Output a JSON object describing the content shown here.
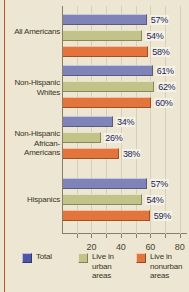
{
  "chart_data": {
    "type": "bar",
    "orientation": "horizontal",
    "title": "",
    "xlabel": "",
    "ylabel": "",
    "xlim": [
      0,
      85
    ],
    "grid": true,
    "xticks": [
      20,
      40,
      60,
      80
    ],
    "categories": [
      "All Americans",
      "Non-Hispanic Whites",
      "Non-Hispanic African-Americans",
      "Hispanics"
    ],
    "category_lines": [
      [
        "All Americans"
      ],
      [
        "Non-Hispanic",
        "Whites"
      ],
      [
        "Non-Hispanic",
        "African-",
        "Americans"
      ],
      [
        "Hispanics"
      ]
    ],
    "series": [
      {
        "name": "Total",
        "color": "#4F55A6",
        "bar_color": "#7F83B8",
        "values": [
          57,
          61,
          34,
          57
        ],
        "labels": [
          "57%",
          "61%",
          "34%",
          "57%"
        ]
      },
      {
        "name": "Live in urban areas",
        "color": "#C3C389",
        "bar_color": "#C3C389",
        "values": [
          54,
          62,
          26,
          54
        ],
        "labels": [
          "54%",
          "62%",
          "26%",
          "54%"
        ]
      },
      {
        "name": "Live in nonurban areas",
        "color": "#E2743C",
        "bar_color": "#E2743C",
        "values": [
          58,
          60,
          38,
          59
        ],
        "labels": [
          "58%",
          "60%",
          "38%",
          "59%"
        ]
      }
    ],
    "legend": {
      "position": "bottom",
      "entries": [
        {
          "label_lines": [
            "Total"
          ],
          "swatch": "#4F55A6"
        },
        {
          "label_lines": [
            "Live in",
            "urban",
            "areas"
          ],
          "swatch": "#C3C389"
        },
        {
          "label_lines": [
            "Live in",
            "nonurban",
            "areas"
          ],
          "swatch": "#E2743C"
        }
      ]
    },
    "background_color": "#ECE6D2",
    "accent_rule_color": "#C2522A"
  }
}
